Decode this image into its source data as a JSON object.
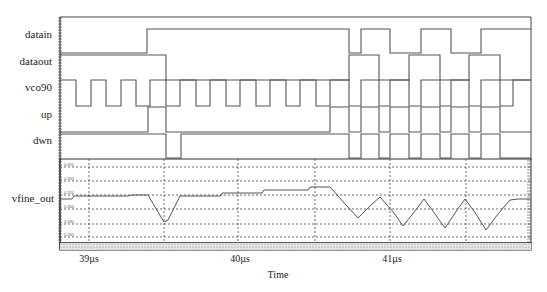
{
  "chart_data": {
    "type": "line",
    "title": "",
    "xlabel": "Time",
    "x_unit": "µs",
    "x_ticks": [
      "39µs",
      "40µs",
      "41µs"
    ],
    "x_range_us": [
      38.81,
      41.95
    ],
    "digital_signals": [
      {
        "name": "datain",
        "initial": 0,
        "transitions_us": [
          39.38,
          40.72,
          40.8,
          40.99,
          41.2,
          41.4,
          41.6
        ]
      },
      {
        "name": "dataout",
        "initial": 0,
        "transitions_us": [
          39.51,
          40.72,
          40.92,
          41.12,
          41.33,
          41.52,
          41.73
        ]
      },
      {
        "name": "vco90",
        "initial": 1,
        "period_us": 0.2
      },
      {
        "name": "up",
        "initial": 0,
        "transitions_us": [
          39.39,
          39.51,
          40.6,
          40.72
        ]
      },
      {
        "name": "dwn",
        "initial": 0,
        "transitions_us": [
          39.51,
          39.61,
          40.72,
          40.8
        ]
      }
    ],
    "analog_signal": {
      "name": "vfine_out",
      "y_tick_labels": [
        "0.355",
        "0.333",
        "0.320",
        "0.300",
        "0.280",
        "0.265"
      ],
      "description": "Stepwise rising level with a V-shaped dip near 39.5µs, then triangular oscillation after 40.6µs"
    },
    "grid": true
  },
  "labels": {
    "signals": [
      "datain",
      "dataout",
      "vco90",
      "up",
      "dwn",
      "vfine_out"
    ],
    "xlabel": "Time",
    "ticks": [
      "39µs",
      "40µs",
      "41µs"
    ]
  }
}
